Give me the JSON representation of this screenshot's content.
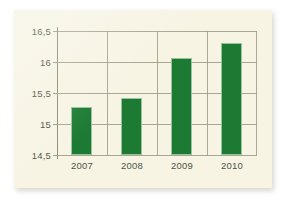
{
  "chart_data": {
    "type": "bar",
    "title": "",
    "subtitle": "",
    "xlabel": "",
    "ylabel": "",
    "categories": [
      "2007",
      "2008",
      "2009",
      "2010"
    ],
    "values": [
      15.28,
      15.42,
      16.07,
      16.31
    ],
    "series": [
      {
        "name": "",
        "values": [
          15.28,
          15.42,
          16.07,
          16.31
        ]
      }
    ],
    "ylim": [
      14.5,
      16.5
    ],
    "ytick_labels": [
      "16,5",
      "16",
      "15,5",
      "15",
      "14,5"
    ],
    "ytick_values": [
      16.5,
      16.0,
      15.5,
      15.0,
      14.5
    ],
    "xtick_labels": [
      "2007",
      "2008",
      "2009",
      "2010"
    ],
    "grid": true,
    "grid_horizontal": true,
    "grid_vertical": true,
    "legend": false,
    "legend_position": "none",
    "decimal_separator": ",",
    "bar_color": "#1c7a33",
    "background_color": "#f7f4e4",
    "grid_color": "#9a9a86",
    "axis_color": "#8d8d79",
    "label_color": "#4e5346"
  }
}
